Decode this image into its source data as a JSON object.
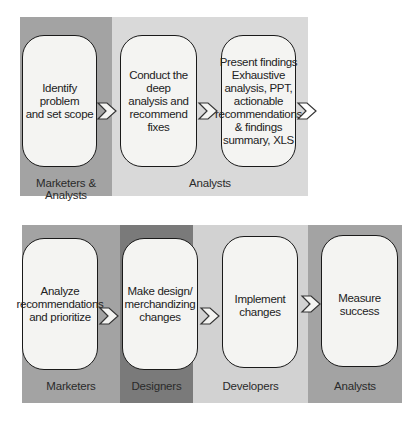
{
  "colors": {
    "band_medium": "#a3a3a3",
    "band_light": "#d9d9d9",
    "band_dark": "#7a7a7a",
    "band_light2": "#d2d2d2",
    "step_fill": "#f4f4f2",
    "step_border": "#1a1a1a"
  },
  "top_row": {
    "bands": [
      {
        "label": "Marketers & Analysts"
      },
      {
        "label": "Analysts"
      }
    ],
    "steps": [
      {
        "text": "Identify problem\nand set scope"
      },
      {
        "text": "Conduct the deep\nanalysis and\nrecommend\nfixes"
      },
      {
        "text": "Present findings\nExhaustive\nanalysis, PPT,\nactionable\nrecommendations\n& findings\nsummary, XLS"
      }
    ],
    "arrows": [
      "chevron-right",
      "chevron-right",
      "chevron-right"
    ]
  },
  "bottom_row": {
    "bands": [
      {
        "label": "Marketers"
      },
      {
        "label": "Designers"
      },
      {
        "label": "Developers"
      },
      {
        "label": "Analysts"
      }
    ],
    "steps": [
      {
        "text": "Analyze\nrecommendations\nand prioritize"
      },
      {
        "text": "Make design/\nmerchandizing\nchanges"
      },
      {
        "text": "Implement\nchanges"
      },
      {
        "text": "Measure\nsuccess"
      }
    ],
    "arrows": [
      "chevron-right",
      "chevron-right",
      "chevron-right"
    ]
  }
}
